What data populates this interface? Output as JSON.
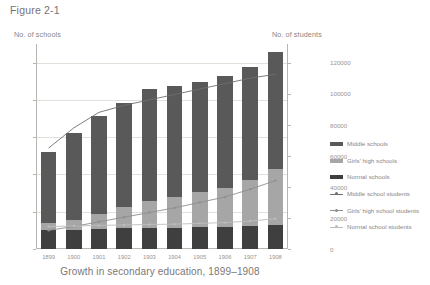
{
  "figure": {
    "label": "Figure 2-1",
    "caption": "Growth in secondary education, 1899–1908"
  },
  "axes": {
    "left_title": "No. of schools",
    "right_title": "No. of students"
  },
  "legend": {
    "items": [
      {
        "label": "Middle schools",
        "marker": "bar-swatch",
        "color": "#595959"
      },
      {
        "label": "Girls' high schools",
        "marker": "bar-swatch",
        "color": "#a6a6a6"
      },
      {
        "label": "Normal schools",
        "marker": "bar-swatch",
        "color": "#3f3f3f"
      },
      {
        "label": "Middle school students",
        "marker": "line-marker",
        "color": "#6e6e6e"
      },
      {
        "label": "Girls' high school students",
        "marker": "line-marker",
        "color": "#8f8f8f"
      },
      {
        "label": "Normal school students",
        "marker": "line-marker",
        "color": "#bdbdbd"
      }
    ]
  },
  "chart_data": {
    "type": "bar",
    "title": "Growth in secondary education, 1899–1908",
    "xlabel": "",
    "ylabel": "No. of schools",
    "y2label": "No. of students",
    "grid": true,
    "legend_position": "right",
    "stacked": true,
    "categories": [
      "1899",
      "1900",
      "1901",
      "1902",
      "1903",
      "1904",
      "1905",
      "1906",
      "1907",
      "1908"
    ],
    "ylim": [
      0,
      550
    ],
    "yticks": [
      0,
      100,
      200,
      300,
      400,
      500
    ],
    "y2lim": [
      0,
      132000
    ],
    "y2ticks": [
      0,
      20000,
      40000,
      60000,
      80000,
      100000,
      120000
    ],
    "series": [
      {
        "name": "Middle schools",
        "axis": "left",
        "kind": "bar",
        "color": "#595959",
        "values": [
          190,
          232,
          262,
          281,
          299,
          299,
          296,
          300,
          305,
          313
        ]
      },
      {
        "name": "Girls' high schools",
        "axis": "left",
        "kind": "bar",
        "color": "#a6a6a6",
        "values": [
          18,
          26,
          40,
          55,
          73,
          82,
          95,
          105,
          122,
          150
        ]
      },
      {
        "name": "Normal schools",
        "axis": "left",
        "kind": "bar",
        "color": "#3f3f3f",
        "values": [
          52,
          52,
          55,
          57,
          57,
          57,
          58,
          60,
          62,
          65
        ]
      },
      {
        "name": "Middle school students",
        "axis": "right",
        "kind": "line",
        "color": "#6e6e6e",
        "values": [
          65000,
          78000,
          88000,
          92500,
          96000,
          99500,
          103000,
          106500,
          110000,
          112500
        ]
      },
      {
        "name": "Girls' high school students",
        "axis": "right",
        "kind": "line",
        "color": "#8f8f8f",
        "values": [
          12000,
          14500,
          17500,
          20500,
          23500,
          26500,
          30000,
          33500,
          38500,
          44000
        ]
      },
      {
        "name": "Normal school students",
        "axis": "right",
        "kind": "line",
        "color": "#bdbdbd",
        "values": [
          14500,
          14800,
          15200,
          15500,
          15800,
          16000,
          16500,
          17000,
          18000,
          19500
        ]
      }
    ]
  }
}
